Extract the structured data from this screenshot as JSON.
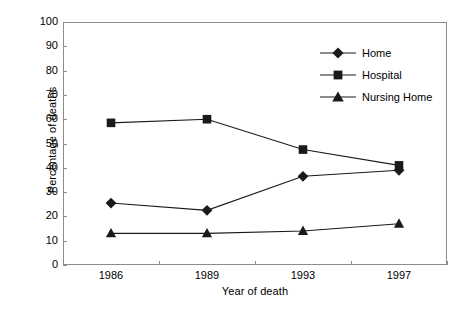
{
  "chart_data": {
    "type": "line",
    "title": "",
    "xlabel": "Year of death",
    "ylabel": "Percentage of deaths",
    "categories": [
      "1986",
      "1989",
      "1993",
      "1997"
    ],
    "ylim": [
      0,
      100
    ],
    "yticks": [
      "0",
      "10",
      "20",
      "30",
      "40",
      "50",
      "60",
      "70",
      "80",
      "90",
      "100"
    ],
    "grid": false,
    "legend_position": "top-right-inside",
    "series": [
      {
        "name": "Home",
        "marker": "diamond",
        "color": "#1a1a1a",
        "values": [
          25.5,
          22.5,
          36.5,
          39
        ]
      },
      {
        "name": "Hospital",
        "marker": "square",
        "color": "#1a1a1a",
        "values": [
          58.5,
          60,
          47.5,
          41
        ]
      },
      {
        "name": "Nursing Home",
        "marker": "triangle",
        "color": "#1a1a1a",
        "values": [
          13,
          13,
          14,
          17
        ]
      }
    ]
  },
  "legend": {
    "items": [
      {
        "label": "Home"
      },
      {
        "label": "Hospital"
      },
      {
        "label": "Nursing Home"
      }
    ]
  }
}
